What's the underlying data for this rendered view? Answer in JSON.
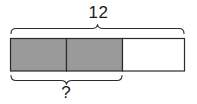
{
  "diagram": {
    "type": "tape-diagram",
    "total_label": "12",
    "unknown_label": "?",
    "segments": [
      {
        "index": 1,
        "fill": "shaded"
      },
      {
        "index": 2,
        "fill": "shaded"
      },
      {
        "index": 3,
        "fill": "unshaded"
      }
    ],
    "shaded_count": 2,
    "total_parts": 3,
    "top_brace_spans": "all-3-parts",
    "bottom_brace_spans": "first-2-parts",
    "colors": {
      "shaded_fill": "#9a9a9a",
      "unshaded_fill": "#ffffff",
      "stroke": "#2b2b2b",
      "brace_stroke": "#2b2b2b",
      "text": "#1a1a1a",
      "background": "#ffffff"
    }
  }
}
